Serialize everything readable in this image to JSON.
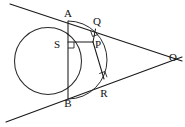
{
  "figure": {
    "background_color": "#ffffff",
    "stroke_color": "#1a1a1a",
    "labels": [
      {
        "id": "A",
        "text": "A",
        "x": 68,
        "y": 14
      },
      {
        "id": "Q",
        "text": "Q",
        "x": 97,
        "y": 22
      },
      {
        "id": "O",
        "text": "O",
        "x": 173,
        "y": 58
      },
      {
        "id": "S",
        "text": "S",
        "x": 57,
        "y": 45
      },
      {
        "id": "P",
        "text": "P",
        "x": 98,
        "y": 45
      },
      {
        "id": "R",
        "text": "R",
        "x": 104,
        "y": 94
      },
      {
        "id": "B",
        "text": "B",
        "x": 68,
        "y": 104
      }
    ],
    "points": {
      "A": {
        "x": 68,
        "y": 21
      },
      "B": {
        "x": 68,
        "y": 99
      },
      "O": {
        "x": 165,
        "y": 58
      },
      "P": {
        "x": 93,
        "y": 42
      },
      "Q": {
        "x": 95,
        "y": 29
      },
      "R": {
        "x": 104,
        "y": 79
      },
      "S": {
        "x": 68,
        "y": 42
      }
    },
    "circle": {
      "cx": 48,
      "cy": 61,
      "r": 33.5
    },
    "lines": [
      {
        "name": "tangent-line-upper",
        "x1": 10,
        "y1": 4,
        "x2": 182,
        "y2": 61
      },
      {
        "name": "tangent-line-lower",
        "x1": 6,
        "y1": 122,
        "x2": 182,
        "y2": 57
      }
    ],
    "segments": [
      {
        "name": "chord-AB",
        "x1": 68,
        "y1": 21,
        "x2": 68,
        "y2": 99
      },
      {
        "name": "segment-PQ",
        "x1": 93,
        "y1": 42,
        "x2": 95.5,
        "y2": 29
      },
      {
        "name": "segment-PR",
        "x1": 93,
        "y1": 42,
        "x2": 104,
        "y2": 79
      },
      {
        "name": "segment-PS",
        "x1": 93,
        "y1": 42,
        "x2": 68,
        "y2": 42
      }
    ],
    "arc": {
      "name": "arc-APB",
      "from_x": 68,
      "from_y": 21,
      "to_x": 68,
      "to_y": 99,
      "rx": 33.5,
      "ry": 33.5
    },
    "right_angles": [
      {
        "name": "right-angle-at-S",
        "x": 68,
        "y": 42,
        "size": 6,
        "dx": 1,
        "dy": 1
      },
      {
        "name": "right-angle-at-Q",
        "x": 95.5,
        "y": 29,
        "size": 6
      },
      {
        "name": "right-angle-at-R",
        "x": 104,
        "y": 79,
        "size": 6
      }
    ]
  }
}
